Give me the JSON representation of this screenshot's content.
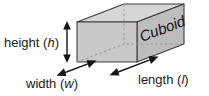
{
  "figure": {
    "shape_label": "Cuboid",
    "labels": {
      "height": {
        "word": "height",
        "open_paren": "(",
        "symbol": "h",
        "close_paren": ")"
      },
      "width": {
        "word": "width",
        "open_paren": "(",
        "symbol": "w",
        "close_paren": ")"
      },
      "length": {
        "word": "length",
        "open_paren": "(",
        "symbol": "l",
        "close_paren": ")"
      }
    },
    "colors": {
      "front_face": "#c9c9c9",
      "right_face": "#bdbdbd",
      "top_face": "#d6d6d6",
      "edge": "#3c3c3c",
      "hidden_edge": "#9a9a9a",
      "arrow": "#141414",
      "text": "#1a1a1a",
      "background": "#ffffff"
    }
  }
}
